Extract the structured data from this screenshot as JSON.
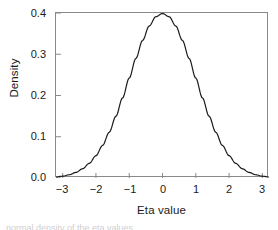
{
  "figure": {
    "background_color": "#ffffff",
    "frame_color": "#8a8a8a",
    "curve_color": "#1a1a1a",
    "caption_sliver": "normal density of the eta values"
  },
  "chart_data": {
    "type": "line",
    "title": "",
    "subtitle": "",
    "xlabel": "Eta value",
    "ylabel": "Density",
    "xlim": [
      -3.2,
      3.2
    ],
    "ylim": [
      0.0,
      0.4
    ],
    "grid": false,
    "legend": null,
    "xticks": [
      -3,
      -2,
      -1,
      0,
      1,
      2,
      3
    ],
    "xtick_labels": [
      "−3",
      "−2",
      "−1",
      "0",
      "1",
      "2",
      "3"
    ],
    "yticks": [
      0.0,
      0.1,
      0.2,
      0.3,
      0.4
    ],
    "ytick_labels": [
      "0.0",
      "0.1",
      "0.2",
      "0.3",
      "0.4"
    ],
    "series": [
      {
        "name": "Standard normal density",
        "x": [
          -3.2,
          -3.0,
          -2.8,
          -2.6,
          -2.4,
          -2.2,
          -2.0,
          -1.8,
          -1.6,
          -1.4,
          -1.2,
          -1.0,
          -0.8,
          -0.6,
          -0.4,
          -0.2,
          0.0,
          0.2,
          0.4,
          0.6,
          0.8,
          1.0,
          1.2,
          1.4,
          1.6,
          1.8,
          2.0,
          2.2,
          2.4,
          2.6,
          2.8,
          3.0,
          3.2
        ],
        "y": [
          0.0024,
          0.0044,
          0.0079,
          0.0136,
          0.0224,
          0.0355,
          0.054,
          0.079,
          0.1109,
          0.1497,
          0.1942,
          0.242,
          0.2897,
          0.3332,
          0.3683,
          0.391,
          0.3989,
          0.391,
          0.3683,
          0.3332,
          0.2897,
          0.242,
          0.1942,
          0.1497,
          0.1109,
          0.079,
          0.054,
          0.0355,
          0.0224,
          0.0136,
          0.0079,
          0.0044,
          0.0024
        ]
      }
    ],
    "peak": {
      "x": 0,
      "y": 0.3989
    }
  }
}
